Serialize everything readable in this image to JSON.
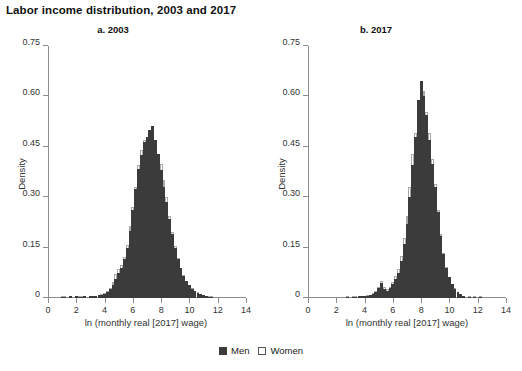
{
  "figure": {
    "title": "Labor income distribution, 2003 and 2017",
    "legend": {
      "men": "Men",
      "women": "Women"
    },
    "colors": {
      "men": "#3b3b3b",
      "women": "#ffffff",
      "women_outline": "#a8a8a8",
      "axis": "#8c8c8c"
    }
  },
  "chart_data": [
    {
      "type": "bar",
      "title": "a. 2003",
      "xlabel": "ln (monthly real [2017] wage)",
      "ylabel": "Density",
      "xlim": [
        0,
        14
      ],
      "ylim": [
        0,
        0.75
      ],
      "xticks": [
        0,
        2,
        4,
        6,
        8,
        10,
        12,
        14
      ],
      "yticks": [
        0,
        0.15,
        0.3,
        0.45,
        0.6,
        0.75
      ],
      "ytick_labels": [
        "0",
        "0.15",
        "0.30",
        "0.45",
        "0.60",
        "0.75"
      ],
      "grid": false,
      "legend_position": "bottom-center",
      "bin_width": 0.2,
      "x": [
        1.0,
        1.2,
        1.6,
        2.0,
        2.2,
        2.4,
        2.6,
        3.0,
        3.2,
        3.4,
        3.6,
        3.8,
        4.0,
        4.2,
        4.4,
        4.6,
        4.8,
        5.0,
        5.2,
        5.4,
        5.6,
        5.8,
        6.0,
        6.2,
        6.4,
        6.6,
        6.8,
        7.0,
        7.2,
        7.4,
        7.6,
        7.8,
        8.0,
        8.2,
        8.4,
        8.6,
        8.8,
        9.0,
        9.2,
        9.4,
        9.6,
        9.8,
        10.0,
        10.2,
        10.4,
        10.6,
        10.8,
        11.0,
        11.2,
        11.4,
        11.6
      ],
      "series": [
        {
          "name": "Men",
          "values": [
            0.004,
            0.004,
            0.005,
            0.005,
            0.004,
            0.004,
            0.005,
            0.005,
            0.006,
            0.007,
            0.008,
            0.01,
            0.013,
            0.018,
            0.026,
            0.04,
            0.058,
            0.073,
            0.09,
            0.115,
            0.15,
            0.2,
            0.262,
            0.325,
            0.385,
            0.425,
            0.465,
            0.48,
            0.5,
            0.512,
            0.47,
            0.43,
            0.38,
            0.33,
            0.285,
            0.235,
            0.19,
            0.15,
            0.115,
            0.088,
            0.066,
            0.05,
            0.038,
            0.028,
            0.021,
            0.016,
            0.012,
            0.009,
            0.006,
            0.004,
            0.002
          ]
        },
        {
          "name": "Women",
          "values": [
            0.004,
            0.004,
            0.005,
            0.005,
            0.004,
            0.004,
            0.005,
            0.005,
            0.006,
            0.007,
            0.009,
            0.011,
            0.015,
            0.021,
            0.031,
            0.048,
            0.07,
            0.085,
            0.098,
            0.122,
            0.158,
            0.215,
            0.27,
            0.33,
            0.395,
            0.44,
            0.47,
            0.462,
            0.49,
            0.5,
            0.462,
            0.42,
            0.4,
            0.352,
            0.3,
            0.245,
            0.196,
            0.155,
            0.118,
            0.09,
            0.068,
            0.052,
            0.039,
            0.029,
            0.022,
            0.017,
            0.013,
            0.01,
            0.007,
            0.004,
            0.002
          ]
        }
      ]
    },
    {
      "type": "bar",
      "title": "b. 2017",
      "xlabel": "ln (monthly real [2017] wage)",
      "ylabel": "Density",
      "xlim": [
        0,
        14
      ],
      "ylim": [
        0,
        0.75
      ],
      "xticks": [
        0,
        2,
        4,
        6,
        8,
        10,
        12,
        14
      ],
      "yticks": [
        0,
        0.15,
        0.3,
        0.45,
        0.6,
        0.75
      ],
      "ytick_labels": [
        "0",
        "0.15",
        "0.30",
        "0.45",
        "0.60",
        "0.75"
      ],
      "grid": false,
      "legend_position": "bottom-center",
      "bin_width": 0.2,
      "annotations": [
        "small spike near ln wage 5.2 (minimum-wage bunching)"
      ],
      "x": [
        2.8,
        3.2,
        3.4,
        3.6,
        3.8,
        4.0,
        4.2,
        4.4,
        4.6,
        4.8,
        5.0,
        5.2,
        5.4,
        5.6,
        5.8,
        6.0,
        6.2,
        6.4,
        6.6,
        6.8,
        7.0,
        7.2,
        7.4,
        7.6,
        7.8,
        8.0,
        8.2,
        8.4,
        8.6,
        8.8,
        9.0,
        9.2,
        9.4,
        9.6,
        9.8,
        10.0,
        10.2,
        10.4,
        10.6,
        10.8,
        11.0,
        11.4,
        11.8,
        12.2
      ],
      "series": [
        {
          "name": "Men",
          "values": [
            0.004,
            0.004,
            0.004,
            0.005,
            0.005,
            0.006,
            0.007,
            0.008,
            0.012,
            0.018,
            0.03,
            0.045,
            0.028,
            0.022,
            0.03,
            0.042,
            0.058,
            0.075,
            0.11,
            0.16,
            0.22,
            0.3,
            0.395,
            0.48,
            0.59,
            0.645,
            0.6,
            0.545,
            0.47,
            0.4,
            0.33,
            0.255,
            0.185,
            0.13,
            0.09,
            0.062,
            0.042,
            0.028,
            0.018,
            0.011,
            0.007,
            0.004,
            0.003,
            0.002
          ]
        },
        {
          "name": "Women",
          "values": [
            0.004,
            0.004,
            0.004,
            0.005,
            0.005,
            0.006,
            0.008,
            0.009,
            0.014,
            0.021,
            0.034,
            0.05,
            0.032,
            0.026,
            0.034,
            0.048,
            0.066,
            0.086,
            0.125,
            0.18,
            0.245,
            0.33,
            0.43,
            0.49,
            0.565,
            0.62,
            0.615,
            0.555,
            0.49,
            0.415,
            0.34,
            0.262,
            0.19,
            0.134,
            0.093,
            0.064,
            0.043,
            0.029,
            0.019,
            0.012,
            0.007,
            0.004,
            0.003,
            0.002
          ]
        }
      ]
    }
  ]
}
